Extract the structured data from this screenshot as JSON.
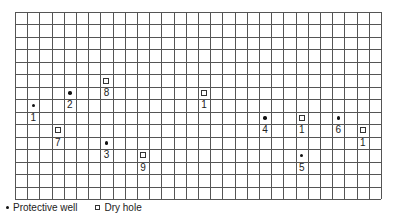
{
  "grid": {
    "columns": 30,
    "rows": 15,
    "line_color": "#555555",
    "background": "#ffffff"
  },
  "points": [
    {
      "type": "protective-well",
      "label": "1",
      "col": 1,
      "row": 7
    },
    {
      "type": "protective-well",
      "label": "2",
      "col": 4,
      "row": 6
    },
    {
      "type": "dry-hole",
      "label": "8",
      "col": 7,
      "row": 5
    },
    {
      "type": "dry-hole",
      "label": "7",
      "col": 3,
      "row": 9
    },
    {
      "type": "protective-well",
      "label": "3",
      "col": 7,
      "row": 10
    },
    {
      "type": "dry-hole",
      "label": "9",
      "col": 10,
      "row": 11
    },
    {
      "type": "dry-hole",
      "label": "1",
      "col": 15,
      "row": 6
    },
    {
      "type": "protective-well",
      "label": "4",
      "col": 20,
      "row": 8
    },
    {
      "type": "dry-hole",
      "label": "1",
      "col": 23,
      "row": 8
    },
    {
      "type": "protective-well",
      "label": "5",
      "col": 23,
      "row": 11
    },
    {
      "type": "protective-well",
      "label": "6",
      "col": 26,
      "row": 8
    },
    {
      "type": "dry-hole",
      "label": "1",
      "col": 28,
      "row": 9
    }
  ],
  "legend": {
    "protective_well": "Protective well",
    "dry_hole": "Dry hole"
  }
}
